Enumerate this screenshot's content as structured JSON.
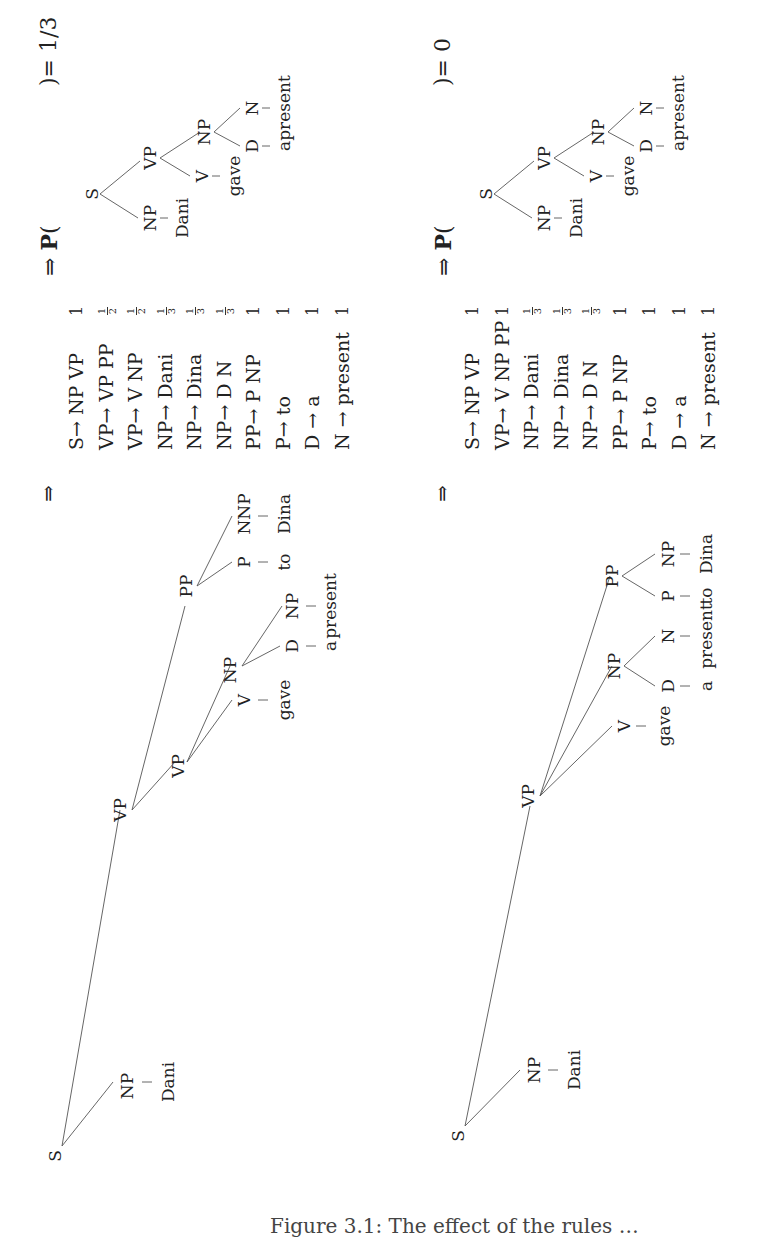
{
  "derivations": [
    {
      "tree": {
        "root": "S",
        "nodes": {
          "S": "S",
          "NP1": "NP",
          "Dani": "Dani",
          "VP_top": "VP",
          "VP_inner": "VP",
          "V": "V",
          "gave": "gave",
          "NP2": "NP",
          "D": "D",
          "a": "a",
          "NP3": "NP",
          "present": "present",
          "PP": "PP",
          "P": "P",
          "to": "to",
          "NNP": "NNP",
          "Dina": "Dina"
        }
      },
      "implies": "⇒",
      "grammar": [
        {
          "rule": "S→ NP VP",
          "prob": "1"
        },
        {
          "rule": "VP→ VP PP",
          "prob": "1/2"
        },
        {
          "rule": "VP→ V NP",
          "prob": "1/2"
        },
        {
          "rule": "NP→ Dani",
          "prob": "1/3"
        },
        {
          "rule": "NP→ Dina",
          "prob": "1/3"
        },
        {
          "rule": "NP→ D N",
          "prob": "1/3"
        },
        {
          "rule": "PP→ P NP",
          "prob": "1"
        },
        {
          "rule": "P→ to",
          "prob": "1"
        },
        {
          "rule": "D → a",
          "prob": "1"
        },
        {
          "rule": "N → present",
          "prob": "1"
        }
      ],
      "result": {
        "implies": "⇒",
        "p_label": "P",
        "open_paren": "(",
        "close_eq": ")= 1/3",
        "tree": {
          "S": "S",
          "NP": "NP",
          "Dani": "Dani",
          "VP": "VP",
          "V": "V",
          "gave": "gave",
          "NP2": "NP",
          "D": "D",
          "a": "a",
          "N": "N",
          "present": "present"
        }
      }
    },
    {
      "tree": {
        "root": "S",
        "nodes": {
          "S": "S",
          "NP1": "NP",
          "Dani": "Dani",
          "VP": "VP",
          "V": "V",
          "gave": "gave",
          "NP2": "NP",
          "D": "D",
          "a": "a",
          "N": "N",
          "present": "present",
          "PP": "PP",
          "P": "P",
          "to": "to",
          "NP3": "NP",
          "Dina": "Dina"
        }
      },
      "implies": "⇒",
      "grammar": [
        {
          "rule": "S→ NP VP",
          "prob": "1"
        },
        {
          "rule": "VP→ V NP PP",
          "prob": "1"
        },
        {
          "rule": "NP→ Dani",
          "prob": "1/3"
        },
        {
          "rule": "NP→ Dina",
          "prob": "1/3"
        },
        {
          "rule": "NP→ D N",
          "prob": "1/3"
        },
        {
          "rule": "PP→ P NP",
          "prob": "1"
        },
        {
          "rule": "P→ to",
          "prob": "1"
        },
        {
          "rule": "D → a",
          "prob": "1"
        },
        {
          "rule": "N → present",
          "prob": "1"
        }
      ],
      "result": {
        "implies": "⇒",
        "p_label": "P",
        "open_paren": "(",
        "close_eq": ")= 0",
        "tree": {
          "S": "S",
          "NP": "NP",
          "Dani": "Dani",
          "VP": "VP",
          "V": "V",
          "gave": "gave",
          "NP2": "NP",
          "D": "D",
          "a": "a",
          "N": "N",
          "present": "present"
        }
      }
    }
  ],
  "caption": "Figure 3.1: The effect of the rules …"
}
